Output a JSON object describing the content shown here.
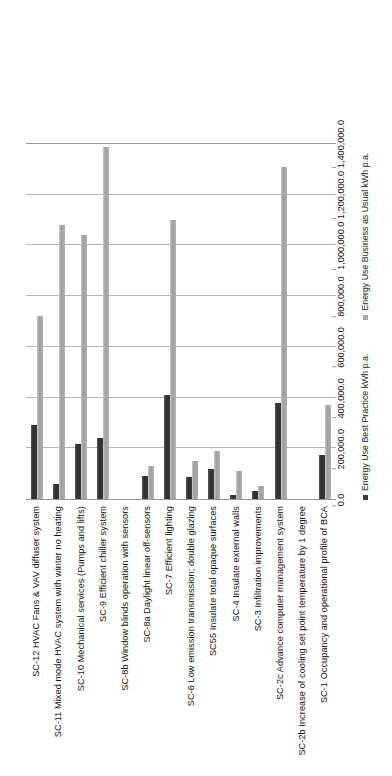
{
  "chart_data": {
    "type": "bar",
    "orientation": "horizontal",
    "title": "",
    "subtitle": "",
    "xlabel": "",
    "ylabel": "",
    "xlim": [
      0,
      1400000
    ],
    "grid": true,
    "grid_step": 200000,
    "legend_position": "bottom",
    "tick_labels": [
      "0.0",
      "200,000.0",
      "400,000.0",
      "600,000.0",
      "800,000.0",
      "1,000,000.0",
      "1,200,000.0",
      "1,400,000.0"
    ],
    "tick_values": [
      0,
      200000,
      400000,
      600000,
      800000,
      1000000,
      1200000,
      1400000
    ],
    "categories": [
      "SC-12 HVAC Fans & VAV diffuser system",
      "SC-11  Mixed mode HVAC system with winter no heating",
      "SC-10 Mechanical services (Pumps and lifts)",
      "SC-9 Efficient chiller system",
      "SC-8b Window blinds operation with sensors",
      "SC-8a Daylight linear off-sensors",
      "SC-7 Efficient lighting",
      "SC-6 Low emission transmission; double glazing",
      "SC55 Insulate total opaque surfaces",
      "SC-4 Insulate external walls",
      "SC-3 Infiltration improvements",
      "SC-2c Advance computer management system",
      "SC-2b Increase of cooling set point temperature by 1 degree",
      "SC-1 Occupancy and operational profile of BCA"
    ],
    "series": [
      {
        "name": "Energy Use Best Practice kWh p.a.",
        "color": "#3a3a3a",
        "values": [
          290000,
          60000,
          215000,
          240000,
          0,
          90000,
          410000,
          85000,
          120000,
          15000,
          30000,
          380000,
          0,
          175000
        ]
      },
      {
        "name": "Energy Use Business as Usual kWh p.a.",
        "color": "#a8a8a8",
        "values": [
          720000,
          1080000,
          1040000,
          1390000,
          0,
          130000,
          1100000,
          150000,
          190000,
          110000,
          50000,
          1310000,
          0,
          370000
        ]
      }
    ]
  },
  "legend": {
    "items": [
      {
        "label": "Energy Use Best Practice kWh p.a.",
        "swatch": "bp"
      },
      {
        "label": "Energy Use Business as Usual kWh p.a.",
        "swatch": "bau"
      }
    ]
  }
}
